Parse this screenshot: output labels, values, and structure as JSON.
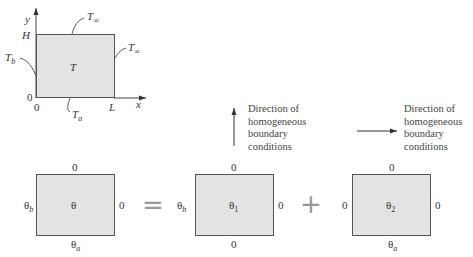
{
  "top_figure": {
    "axis_y_label": "y",
    "axis_x_label": "x",
    "height_label": "H",
    "origin_y_label": "0",
    "origin_x_label": "0",
    "length_label": "L",
    "interior_label": "T",
    "top_boundary": {
      "main": "T",
      "sub": "∞"
    },
    "right_boundary": {
      "main": "T",
      "sub": "∞"
    },
    "left_boundary": {
      "main": "T",
      "sub": "b"
    },
    "bottom_boundary": {
      "main": "T",
      "sub": "a"
    }
  },
  "annotations": {
    "vertical": [
      "Direction of",
      "homogeneous",
      "boundary",
      "conditions"
    ],
    "horizontal": [
      "Direction of",
      "homogeneous",
      "boundary",
      "conditions"
    ]
  },
  "equation": {
    "equals": "=",
    "plus": "+",
    "boxes": [
      {
        "interior": {
          "main": "θ",
          "sub": ""
        },
        "top": {
          "main": "0",
          "sub": ""
        },
        "right": {
          "main": "0",
          "sub": ""
        },
        "left": {
          "main": "θ",
          "sub": "b"
        },
        "bottom": {
          "main": "θ",
          "sub": "a"
        }
      },
      {
        "interior": {
          "main": "θ",
          "sub": "1"
        },
        "top": {
          "main": "0",
          "sub": ""
        },
        "right": {
          "main": "0",
          "sub": ""
        },
        "left": {
          "main": "θ",
          "sub": "b"
        },
        "bottom": {
          "main": "0",
          "sub": ""
        }
      },
      {
        "interior": {
          "main": "θ",
          "sub": "2"
        },
        "top": {
          "main": "0",
          "sub": ""
        },
        "right": {
          "main": "0",
          "sub": ""
        },
        "left": {
          "main": "0",
          "sub": ""
        },
        "bottom": {
          "main": "θ",
          "sub": "a"
        }
      }
    ]
  },
  "colors": {
    "box_fill": "#e3e3e3",
    "box_border": "#555555",
    "operator": "#999999"
  }
}
